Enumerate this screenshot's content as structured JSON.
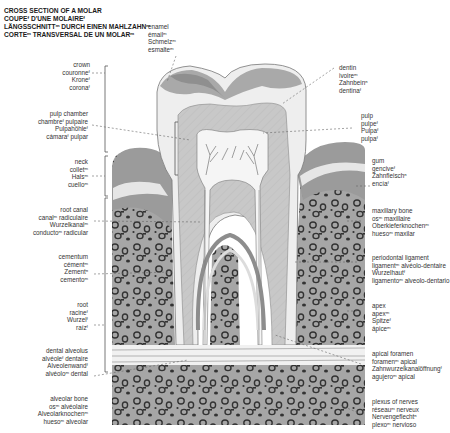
{
  "title": {
    "lines": [
      "CROSS SECTION OF A MOLAR",
      "COUPEᶠ D'UNE MOLAIREᶠ",
      "LÄNGSSCHNITTᵐ DURCH EINEN MAHLZAHNᵐ",
      "CORTEᵐ TRANSVERSAL DE UN MOLARᵐ"
    ]
  },
  "labels": {
    "enamel": [
      "enamel",
      "émailᵐ",
      "Schmelzᵐ",
      "esmalteᵐ"
    ],
    "crown": [
      "crown",
      "couronneᶠ",
      "Kroneᶠ",
      "coronaᶠ"
    ],
    "pulp_chamber": [
      "pulp chamber",
      "chambreᶠ pulpaire",
      "Pulpahöhleᶠ",
      "cámaraᶠ pulpar"
    ],
    "neck": [
      "neck",
      "colletᵐ",
      "Halsᵐ",
      "cuelloᵐ"
    ],
    "root_canal": [
      "root canal",
      "canalᵐ radiculaire",
      "Wurzelkanalᵐ",
      "conductoᵐ radicular"
    ],
    "cementum": [
      "cementum",
      "cémentᵐ",
      "Zementⁿ",
      "cementoᵐ"
    ],
    "root": [
      "root",
      "racineᶠ",
      "Wurzelᶠ",
      "raízᶠ"
    ],
    "dental_alveolus": [
      "dental alveolus",
      "alvéoleᶠ dentaire",
      "Alveolenwandᶠ",
      "alvéoloᵐ dental"
    ],
    "alveolar_bone": [
      "alveolar bone",
      "osᵐ alvéolaire",
      "Alveolarknochenᵐ",
      "huesoᵐ alveolar"
    ],
    "dentin": [
      "dentin",
      "ivoireᵐ",
      "Zahnbeinⁿ",
      "dentinaᶠ"
    ],
    "pulp": [
      "pulp",
      "pulpeᶠ",
      "Pulpaᶠ",
      "pulpaᶠ"
    ],
    "gum": [
      "gum",
      "genciveᶠ",
      "Zahnfleischⁿ",
      "encíaᶠ"
    ],
    "maxillary_bone": [
      "maxillary bone",
      "osᵐ maxillaire",
      "Oberkieferknochenᵐ",
      "huesoᵐ maxilar"
    ],
    "periodontal_ligament": [
      "periodontal ligament",
      "ligamentᵐ alvéolo-dentaire",
      "Wurzelhautᶠ",
      "ligamentoᵐ alveolo-dentario"
    ],
    "apex": [
      "apex",
      "apexᵐ",
      "Spitzeᶠ",
      "ápiceᵐ"
    ],
    "apical_foramen": [
      "apical foramen",
      "foramenᵐ apical",
      "Zahnwurzelkanalöffnungᶠ",
      "agujeroᵐ apical"
    ],
    "plexus_of_nerves": [
      "plexus of nerves",
      "réseauᵐ nerveux",
      "Nervengeflechtⁿ",
      "plexoᵐ nervioso"
    ]
  },
  "colors": {
    "enamel": "#ececec",
    "dentin": "#c9c9c9",
    "pulp": "#f4f4f4",
    "gum": "#9a9a9a",
    "bone_fill": "#a8a8a8",
    "bone_spot": "#3a3a3a",
    "ligament": "#e2e2e2",
    "leader": "#666666"
  }
}
